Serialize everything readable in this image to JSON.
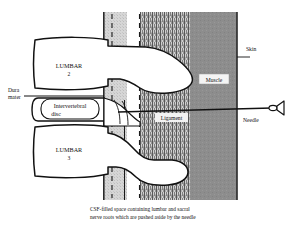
{
  "figure": {
    "caption_line_1": "CSF-filled space containing lumbar and sacral",
    "caption_line_2": "nerve roots which are pushed aside by the needle"
  },
  "labels": {
    "dura_mater_line_1": "Dura",
    "dura_mater_line_2": "mater",
    "intervertebral_disc_line_1": "Intervertebral",
    "intervertebral_disc_line_2": "disc",
    "lumbar2_name": "LUMBAR",
    "lumbar2_number": "2",
    "lumbar3_name": "LUMBAR",
    "lumbar3_number": "3",
    "ligament": "Ligament",
    "muscle": "Muscle",
    "skin": "Skin",
    "needle": "Needle"
  },
  "colors": {
    "csf_space": "#d3d3d3",
    "ligament_band": "#b9b9b9",
    "muscle_band": "#8d8d8d",
    "bone_fill": "#ffffff",
    "outline": "#111111",
    "page_background": "#ffffff"
  },
  "structures": [
    {
      "name": "csf-space",
      "kind": "vertical-band",
      "shading": "light-gray-stipple"
    },
    {
      "name": "ligament",
      "kind": "vertical-band",
      "shading": "vertical-hatch"
    },
    {
      "name": "muscle",
      "kind": "vertical-band",
      "shading": "mid-gray"
    },
    {
      "name": "skin",
      "kind": "boundary-line",
      "shading": "none"
    },
    {
      "name": "lumbar-2-vertebra",
      "kind": "bone",
      "shading": "white"
    },
    {
      "name": "lumbar-3-vertebra",
      "kind": "bone",
      "shading": "white"
    },
    {
      "name": "intervertebral-disc",
      "kind": "disc",
      "shading": "white"
    },
    {
      "name": "needle",
      "kind": "instrument",
      "shading": "white"
    }
  ]
}
